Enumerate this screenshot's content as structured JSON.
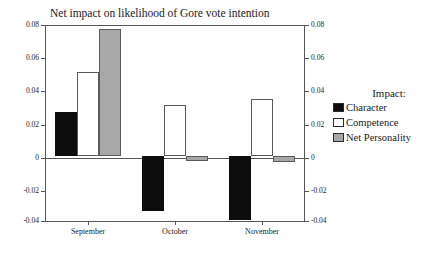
{
  "chart_data": {
    "type": "bar",
    "title": "Net impact on likelihood of Gore vote intention",
    "xlabel": "",
    "ylabel": "",
    "categories": [
      "September",
      "October",
      "November"
    ],
    "series": [
      {
        "name": "Character",
        "color": "#0d0d0d",
        "values": [
          0.0265,
          -0.034,
          -0.0392
        ]
      },
      {
        "name": "Competence",
        "color": "#ffffff",
        "values": [
          0.051,
          0.031,
          0.035
        ]
      },
      {
        "name": "Net Personality",
        "color": "#a8a8a8",
        "values": [
          0.0775,
          -0.003,
          -0.004
        ]
      }
    ],
    "ylim": [
      -0.04,
      0.08
    ],
    "yticks": [
      0.08,
      0.06,
      0.04,
      0.02,
      0,
      -0.02,
      -0.04
    ],
    "ytick_labels": [
      "0.08",
      "0.06",
      "0.04",
      "0.02",
      "0",
      "-0.02",
      "-0.04"
    ],
    "right_axis": true,
    "right_ytick_labels": [
      "0.08",
      "0.06",
      "0.04",
      "0.02",
      "0",
      "-0.02",
      "-0.04"
    ],
    "grid": false,
    "legend_position": "right",
    "legend_title": "Impact:",
    "zero_line": true
  },
  "legend": {
    "title": "Impact:",
    "entries": [
      {
        "label": "Character",
        "swatch": "swatch-black"
      },
      {
        "label": "Competence",
        "swatch": "swatch-white"
      },
      {
        "label": "Net Personality",
        "swatch": "swatch-gray"
      }
    ]
  }
}
